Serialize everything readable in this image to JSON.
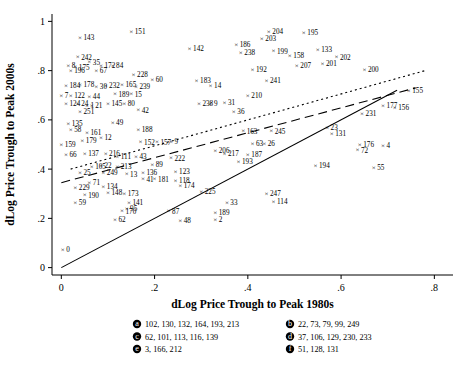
{
  "chart_data": {
    "type": "scatter",
    "title": "",
    "xlabel": "dLog Price Trough to Peak 1980s",
    "ylabel": "dLog Price Trough to Peak 2000s",
    "xlim": [
      -0.02,
      0.84
    ],
    "ylim": [
      -0.03,
      1.03
    ],
    "xticks": [
      0,
      0.2,
      0.4,
      0.6,
      0.8
    ],
    "xtick_labels": [
      "0",
      ".2",
      ".4",
      ".6",
      ".8"
    ],
    "yticks": [
      0,
      0.2,
      0.4,
      0.6,
      0.8,
      1.0
    ],
    "ytick_labels": [
      "0",
      ".2",
      ".4",
      ".6",
      ".8",
      "1"
    ],
    "grid": false,
    "legend_position": "below-axis",
    "lines": [
      {
        "name": "45-degree line",
        "style": "solid",
        "x": [
          0.0,
          0.72
        ],
        "y": [
          0.0,
          0.72
        ]
      },
      {
        "name": "fitted line",
        "style": "dashed",
        "x": [
          0.0,
          0.76
        ],
        "y": [
          0.345,
          0.73
        ]
      },
      {
        "name": "upper line",
        "style": "dotted",
        "x": [
          0.02,
          0.78
        ],
        "y": [
          0.4,
          0.8
        ]
      }
    ],
    "points": [
      {
        "label": "143",
        "x": 0.04,
        "y": 0.935
      },
      {
        "label": "151",
        "x": 0.15,
        "y": 0.96
      },
      {
        "label": "204",
        "x": 0.445,
        "y": 0.96
      },
      {
        "label": "195",
        "x": 0.52,
        "y": 0.955
      },
      {
        "label": "203",
        "x": 0.43,
        "y": 0.93
      },
      {
        "label": "186",
        "x": 0.375,
        "y": 0.905
      },
      {
        "label": "142",
        "x": 0.275,
        "y": 0.89
      },
      {
        "label": "238",
        "x": 0.385,
        "y": 0.875
      },
      {
        "label": "199",
        "x": 0.455,
        "y": 0.88
      },
      {
        "label": "133",
        "x": 0.55,
        "y": 0.885
      },
      {
        "label": "242",
        "x": 0.035,
        "y": 0.855
      },
      {
        "label": "158",
        "x": 0.49,
        "y": 0.86
      },
      {
        "label": "202",
        "x": 0.59,
        "y": 0.855
      },
      {
        "label": "35",
        "x": 0.06,
        "y": 0.835
      },
      {
        "label": "8",
        "x": 0.015,
        "y": 0.82
      },
      {
        "label": "175",
        "x": 0.03,
        "y": 0.815
      },
      {
        "label": "172",
        "x": 0.085,
        "y": 0.82
      },
      {
        "label": "84",
        "x": 0.11,
        "y": 0.82
      },
      {
        "label": "207",
        "x": 0.505,
        "y": 0.82
      },
      {
        "label": "201",
        "x": 0.56,
        "y": 0.83
      },
      {
        "label": "196",
        "x": 0.02,
        "y": 0.8
      },
      {
        "label": "67",
        "x": 0.075,
        "y": 0.8
      },
      {
        "label": "192",
        "x": 0.41,
        "y": 0.805
      },
      {
        "label": "200",
        "x": 0.65,
        "y": 0.805
      },
      {
        "label": "228",
        "x": 0.155,
        "y": 0.785
      },
      {
        "label": "60",
        "x": 0.195,
        "y": 0.765
      },
      {
        "label": "183",
        "x": 0.29,
        "y": 0.76
      },
      {
        "label": "241",
        "x": 0.44,
        "y": 0.76
      },
      {
        "label": "184",
        "x": 0.01,
        "y": 0.74
      },
      {
        "label": "178",
        "x": 0.04,
        "y": 0.745
      },
      {
        "label": "30",
        "x": 0.075,
        "y": 0.735
      },
      {
        "label": "232",
        "x": 0.095,
        "y": 0.74
      },
      {
        "label": "165",
        "x": 0.13,
        "y": 0.745
      },
      {
        "label": "239",
        "x": 0.16,
        "y": 0.735
      },
      {
        "label": "14",
        "x": 0.32,
        "y": 0.74
      },
      {
        "label": "155",
        "x": 0.745,
        "y": 0.72
      },
      {
        "label": "7",
        "x": 0.0,
        "y": 0.7
      },
      {
        "label": "122",
        "x": 0.02,
        "y": 0.7
      },
      {
        "label": "44",
        "x": 0.06,
        "y": 0.695
      },
      {
        "label": "189",
        "x": 0.115,
        "y": 0.705
      },
      {
        "label": "15",
        "x": 0.15,
        "y": 0.705
      },
      {
        "label": "210",
        "x": 0.4,
        "y": 0.7
      },
      {
        "label": "124",
        "x": 0.01,
        "y": 0.665
      },
      {
        "label": "24",
        "x": 0.035,
        "y": 0.665
      },
      {
        "label": "1",
        "x": 0.055,
        "y": 0.66
      },
      {
        "label": "21",
        "x": 0.065,
        "y": 0.66
      },
      {
        "label": "145",
        "x": 0.1,
        "y": 0.665
      },
      {
        "label": "80",
        "x": 0.135,
        "y": 0.665
      },
      {
        "label": "238",
        "x": 0.295,
        "y": 0.665
      },
      {
        "label": "9",
        "x": 0.32,
        "y": 0.665
      },
      {
        "label": "31",
        "x": 0.35,
        "y": 0.67
      },
      {
        "label": "177",
        "x": 0.69,
        "y": 0.66
      },
      {
        "label": "156",
        "x": 0.715,
        "y": 0.65
      },
      {
        "label": "251",
        "x": 0.04,
        "y": 0.635
      },
      {
        "label": "42",
        "x": 0.165,
        "y": 0.64
      },
      {
        "label": "36",
        "x": 0.37,
        "y": 0.635
      },
      {
        "label": "231",
        "x": 0.645,
        "y": 0.625
      },
      {
        "label": "135",
        "x": 0.015,
        "y": 0.585
      },
      {
        "label": "49",
        "x": 0.11,
        "y": 0.59
      },
      {
        "label": "58",
        "x": 0.02,
        "y": 0.56
      },
      {
        "label": "161",
        "x": 0.055,
        "y": 0.55
      },
      {
        "label": "188",
        "x": 0.165,
        "y": 0.56
      },
      {
        "label": "163",
        "x": 0.39,
        "y": 0.555
      },
      {
        "label": "245",
        "x": 0.45,
        "y": 0.555
      },
      {
        "label": "23",
        "x": 0.57,
        "y": 0.57
      },
      {
        "label": "131",
        "x": 0.58,
        "y": 0.545
      },
      {
        "label": "12",
        "x": 0.085,
        "y": 0.53
      },
      {
        "label": "179",
        "x": 0.045,
        "y": 0.515
      },
      {
        "label": "152",
        "x": 0.17,
        "y": 0.51
      },
      {
        "label": "157",
        "x": 0.205,
        "y": 0.51
      },
      {
        "label": "9",
        "x": 0.235,
        "y": 0.512
      },
      {
        "label": "63",
        "x": 0.41,
        "y": 0.505
      },
      {
        "label": "26",
        "x": 0.435,
        "y": 0.505
      },
      {
        "label": "159",
        "x": 0.0,
        "y": 0.5
      },
      {
        "label": "176",
        "x": 0.64,
        "y": 0.5
      },
      {
        "label": "4",
        "x": 0.69,
        "y": 0.495
      },
      {
        "label": "72",
        "x": 0.635,
        "y": 0.478
      },
      {
        "label": "66",
        "x": 0.01,
        "y": 0.46
      },
      {
        "label": "137",
        "x": 0.05,
        "y": 0.465
      },
      {
        "label": "216",
        "x": 0.095,
        "y": 0.465
      },
      {
        "label": "206",
        "x": 0.33,
        "y": 0.475
      },
      {
        "label": "217",
        "x": 0.35,
        "y": 0.465
      },
      {
        "label": "187",
        "x": 0.4,
        "y": 0.46
      },
      {
        "label": "111",
        "x": 0.12,
        "y": 0.45
      },
      {
        "label": "43",
        "x": 0.16,
        "y": 0.45
      },
      {
        "label": "222",
        "x": 0.235,
        "y": 0.445
      },
      {
        "label": "193",
        "x": 0.38,
        "y": 0.43
      },
      {
        "label": "194",
        "x": 0.545,
        "y": 0.415
      },
      {
        "label": "55",
        "x": 0.67,
        "y": 0.405
      },
      {
        "label": "105",
        "x": 0.065,
        "y": 0.41
      },
      {
        "label": "22",
        "x": 0.085,
        "y": 0.415
      },
      {
        "label": "213",
        "x": 0.12,
        "y": 0.41
      },
      {
        "label": "89",
        "x": 0.195,
        "y": 0.42
      },
      {
        "label": "25",
        "x": 0.04,
        "y": 0.385
      },
      {
        "label": "249",
        "x": 0.09,
        "y": 0.385
      },
      {
        "label": "13",
        "x": 0.14,
        "y": 0.38
      },
      {
        "label": "136",
        "x": 0.175,
        "y": 0.385
      },
      {
        "label": "123",
        "x": 0.245,
        "y": 0.39
      },
      {
        "label": "41",
        "x": 0.175,
        "y": 0.36
      },
      {
        "label": "181",
        "x": 0.2,
        "y": 0.36
      },
      {
        "label": "118",
        "x": 0.245,
        "y": 0.355
      },
      {
        "label": "71",
        "x": 0.06,
        "y": 0.345
      },
      {
        "label": "174",
        "x": 0.255,
        "y": 0.335
      },
      {
        "label": "229",
        "x": 0.03,
        "y": 0.325
      },
      {
        "label": "134",
        "x": 0.09,
        "y": 0.33
      },
      {
        "label": "225",
        "x": 0.3,
        "y": 0.31
      },
      {
        "label": "190",
        "x": 0.05,
        "y": 0.295
      },
      {
        "label": "148",
        "x": 0.1,
        "y": 0.305
      },
      {
        "label": "173",
        "x": 0.135,
        "y": 0.3
      },
      {
        "label": "247",
        "x": 0.44,
        "y": 0.3
      },
      {
        "label": "59",
        "x": 0.03,
        "y": 0.265
      },
      {
        "label": "141",
        "x": 0.145,
        "y": 0.265
      },
      {
        "label": "33",
        "x": 0.355,
        "y": 0.265
      },
      {
        "label": "114",
        "x": 0.455,
        "y": 0.27
      },
      {
        "label": "95",
        "x": 0.14,
        "y": 0.24
      },
      {
        "label": "170",
        "x": 0.13,
        "y": 0.23
      },
      {
        "label": "87",
        "x": 0.23,
        "y": 0.23
      },
      {
        "label": "189",
        "x": 0.33,
        "y": 0.225
      },
      {
        "label": "62",
        "x": 0.115,
        "y": 0.195
      },
      {
        "label": "48",
        "x": 0.255,
        "y": 0.19
      },
      {
        "label": "2",
        "x": 0.33,
        "y": 0.195
      },
      {
        "label": "0",
        "x": 0.003,
        "y": 0.075
      }
    ],
    "legend_groups": [
      {
        "marker": "a",
        "label": "102, 130, 132, 164, 193, 213"
      },
      {
        "marker": "b",
        "label": "22, 73, 79, 99, 249"
      },
      {
        "marker": "c",
        "label": "62, 101, 113, 116, 139"
      },
      {
        "marker": "d",
        "label": "37, 106, 129, 230, 233"
      },
      {
        "marker": "e",
        "label": "3, 166, 212"
      },
      {
        "marker": "f",
        "label": "51, 128, 131"
      }
    ]
  },
  "legend": {
    "markers": [
      "a",
      "b",
      "c",
      "d",
      "e",
      "f"
    ]
  }
}
